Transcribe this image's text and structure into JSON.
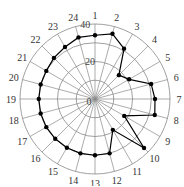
{
  "chart_data": {
    "type": "radar",
    "title": "",
    "categories": [
      "1",
      "2",
      "3",
      "4",
      "5",
      "6",
      "7",
      "8",
      "9",
      "10",
      "11",
      "12",
      "13",
      "14",
      "15",
      "16",
      "17",
      "18",
      "19",
      "20",
      "21",
      "22",
      "23",
      "24"
    ],
    "series": [
      {
        "name": "series",
        "values": [
          34,
          36,
          31,
          18,
          21,
          31,
          32,
          33,
          18,
          37,
          19,
          30,
          30,
          30,
          30,
          30,
          30,
          30,
          30,
          30,
          30,
          31,
          32,
          34
        ]
      }
    ],
    "radial_ticks": [
      0,
      20,
      40
    ],
    "rlim": [
      0,
      40
    ],
    "ring_count": 4,
    "grid": true,
    "legend": null,
    "colors": {
      "line": "#000000",
      "grid": "#888888"
    }
  }
}
